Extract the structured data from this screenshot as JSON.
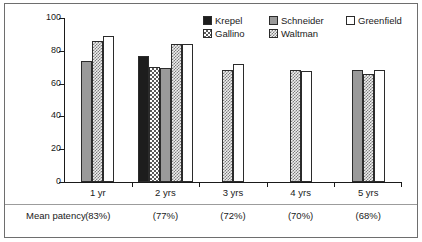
{
  "chart_data": {
    "type": "bar",
    "title": "",
    "subtitle": "",
    "xlabel": "",
    "ylabel": "Patency (%)",
    "ylim": [
      0,
      100
    ],
    "ytick_labels": [
      "0",
      "20",
      "40",
      "60",
      "80",
      "100"
    ],
    "ytick_values": [
      0,
      20,
      40,
      60,
      80,
      100
    ],
    "grid": false,
    "legend_position": "top-right",
    "categories": [
      "1 yr",
      "2 yrs",
      "3 yrs",
      "4 yrs",
      "5 yrs"
    ],
    "series": [
      {
        "name": "Krepel",
        "fill": "solid-black",
        "values": [
          null,
          77,
          null,
          null,
          null
        ]
      },
      {
        "name": "Gallino",
        "fill": "check-coarse",
        "values": [
          null,
          70,
          null,
          null,
          null
        ]
      },
      {
        "name": "Schneider",
        "fill": "solid-gray",
        "values": [
          74,
          69.5,
          null,
          null,
          68.5
        ]
      },
      {
        "name": "Waltman",
        "fill": "check-fine",
        "values": [
          86,
          84,
          68.5,
          68.5,
          66
        ]
      },
      {
        "name": "Greenfield",
        "fill": "white",
        "values": [
          89,
          84,
          72,
          67.5,
          68.5
        ]
      }
    ],
    "annotations": {
      "mean_patency_label": "Mean patency",
      "mean_patency_values": [
        "(83%)",
        "(77%)",
        "(72%)",
        "(70%)",
        "(68%)"
      ]
    }
  },
  "legend": {
    "rows": [
      [
        {
          "label": "Krepel",
          "fill": "solid-black"
        },
        {
          "label": "Schneider",
          "fill": "solid-gray"
        },
        {
          "label": "Greenfield",
          "fill": "white"
        }
      ],
      [
        {
          "label": "Gallino",
          "fill": "check-coarse"
        },
        {
          "label": "Waltman",
          "fill": "check-fine"
        }
      ]
    ]
  },
  "colors": {
    "axis": "#1a1a1a",
    "frame": "#6e6e6e",
    "bar_outline": "#2b2b2b",
    "solid_black": "#1d1d1d",
    "solid_gray": "#9a9a9a",
    "white": "#ffffff"
  }
}
